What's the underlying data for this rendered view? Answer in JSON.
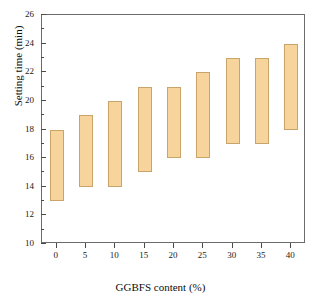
{
  "chart_data": {
    "type": "bar",
    "bar_style": "floating-range",
    "title": "",
    "xlabel": "GGBFS content (%)",
    "ylabel": "Setting time (min)",
    "categories": [
      "0",
      "5",
      "10",
      "15",
      "20",
      "25",
      "30",
      "35",
      "40"
    ],
    "x": [
      0,
      5,
      10,
      15,
      20,
      25,
      30,
      35,
      40
    ],
    "xlim": [
      -2.5,
      42.5
    ],
    "xticks": [
      "0",
      "5",
      "10",
      "15",
      "20",
      "25",
      "30",
      "35",
      "40"
    ],
    "ylim": [
      10,
      26
    ],
    "yticks": [
      "10",
      "12",
      "14",
      "16",
      "18",
      "20",
      "22",
      "24",
      "26"
    ],
    "y_minor_interval": 1,
    "grid": false,
    "legend": null,
    "series": [
      {
        "name": "Setting time range (bottom)",
        "values": [
          13,
          14,
          14,
          15,
          16,
          16,
          17,
          17,
          18
        ]
      },
      {
        "name": "Setting time range (top)",
        "values": [
          18,
          19,
          20,
          21,
          21,
          22,
          23,
          23,
          24
        ]
      }
    ],
    "bars": [
      {
        "category": "0",
        "low": 13,
        "high": 18
      },
      {
        "category": "5",
        "low": 14,
        "high": 19
      },
      {
        "category": "10",
        "low": 14,
        "high": 20
      },
      {
        "category": "15",
        "low": 15,
        "high": 21
      },
      {
        "category": "20",
        "low": 16,
        "high": 21
      },
      {
        "category": "25",
        "low": 16,
        "high": 22
      },
      {
        "category": "30",
        "low": 17,
        "high": 23
      },
      {
        "category": "35",
        "low": 17,
        "high": 23
      },
      {
        "category": "40",
        "low": 18,
        "high": 24
      }
    ],
    "colors": {
      "bar_fill": "#f7d49c",
      "bar_edge": "#c8a36a",
      "axis": "#6b6b6b",
      "text": "#0d0d0d"
    }
  }
}
